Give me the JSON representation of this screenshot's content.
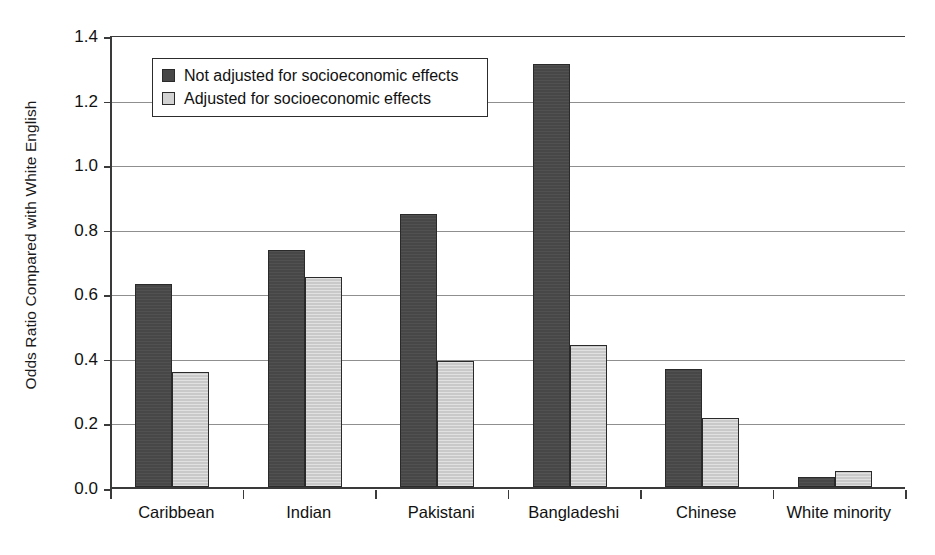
{
  "chart_data": {
    "type": "bar",
    "title": "",
    "subtitle": "",
    "xlabel": "",
    "ylabel": "Odds Ratio Compared with White English",
    "ylim": [
      0.0,
      1.4
    ],
    "yticks": [
      "0.0",
      "0.2",
      "0.4",
      "0.6",
      "0.8",
      "1.0",
      "1.2",
      "1.4"
    ],
    "ytick_values": [
      0.0,
      0.2,
      0.4,
      0.6,
      0.8,
      1.0,
      1.2,
      1.4
    ],
    "grid": "horizontal",
    "legend_position": "upper-left-inside",
    "categories": [
      "Caribbean",
      "Indian",
      "Pakistani",
      "Bangladeshi",
      "Chinese",
      "White minority"
    ],
    "series": [
      {
        "name": "Not adjusted for socioeconomic effects",
        "color": "#474747",
        "values": [
          0.63,
          0.735,
          0.845,
          1.31,
          0.365,
          0.03
        ]
      },
      {
        "name": "Adjusted for socioeconomic effects",
        "color": "#c9c9c9",
        "values": [
          0.355,
          0.65,
          0.39,
          0.44,
          0.215,
          0.05
        ]
      }
    ],
    "annotations": []
  },
  "legend": {
    "items": [
      {
        "label": "Not adjusted for socioeconomic effects",
        "swatch": "series-dark"
      },
      {
        "label": "Adjusted for socioeconomic effects",
        "swatch": "series-light"
      }
    ]
  },
  "axes": {
    "y_title": "Odds Ratio Compared with White English"
  }
}
